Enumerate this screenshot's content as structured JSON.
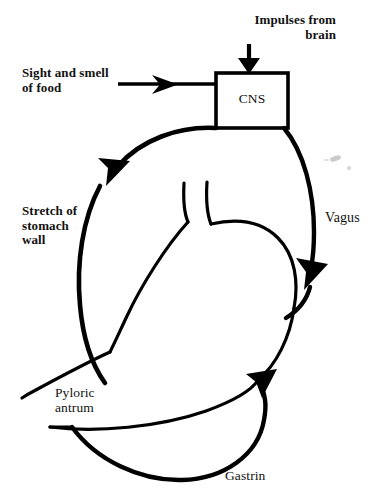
{
  "figure": {
    "line_color": "#000000",
    "background_color": "#ffffff",
    "width": 381,
    "height": 499
  },
  "nodes": {
    "cns_box": {
      "label": "CNS",
      "x": 216,
      "y": 73,
      "width": 72,
      "height": 55
    }
  },
  "labels": {
    "impulses_from_brain": "Impulses from\nbrain",
    "sight_and_smell_of_food": "Sight and smell\nof food",
    "stretch_of_stomach_wall": "Stretch of\nstomach\nwall",
    "vagus": "Vagus",
    "pyloric_antrum": "Pyloric\nantrum",
    "gastrin": "Gastrin"
  },
  "arrows": [
    {
      "name": "impulses-arrow",
      "from": "brain",
      "to": "CNS",
      "direction": "down",
      "label": "Impulses from brain"
    },
    {
      "name": "sight-smell-arrow",
      "from": "Sight and smell of food",
      "to": "CNS",
      "direction": "right",
      "label": "Sight and smell of food"
    },
    {
      "name": "stretch-arrow",
      "from": "stomach wall",
      "to": "CNS",
      "direction": "up-right",
      "label": "Stretch of stomach wall"
    },
    {
      "name": "vagus-arrow",
      "from": "CNS",
      "to": "stomach",
      "direction": "down-right",
      "label": "Vagus"
    },
    {
      "name": "gastrin-arrow",
      "from": "Pyloric antrum",
      "to": "stomach body",
      "direction": "up-left",
      "label": "Gastrin"
    }
  ]
}
